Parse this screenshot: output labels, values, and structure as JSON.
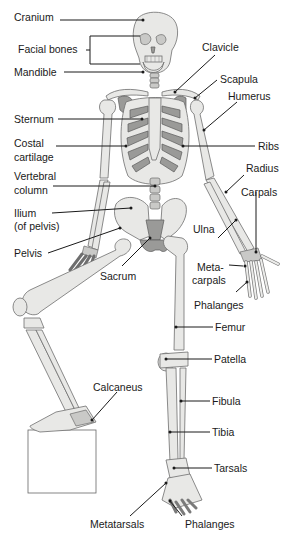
{
  "diagram": {
    "labels": {
      "cranium": "Cranium",
      "facial_bones": "Facial bones",
      "mandible": "Mandible",
      "clavicle": "Clavicle",
      "scapula": "Scapula",
      "humerus": "Humerus",
      "sternum": "Sternum",
      "costal_cartilage_1": "Costal",
      "costal_cartilage_2": "cartilage",
      "ribs": "Ribs",
      "vertebral_column_1": "Vertebral",
      "vertebral_column_2": "column",
      "radius": "Radius",
      "carpals": "Carpals",
      "ilium_1": "Ilium",
      "ilium_2": "(of pelvis)",
      "ulna": "Ulna",
      "pelvis": "Pelvis",
      "sacrum": "Sacrum",
      "metacarpals_1": "Meta-",
      "metacarpals_2": "carpals",
      "phalanges_hand": "Phalanges",
      "femur": "Femur",
      "patella": "Patella",
      "fibula": "Fibula",
      "calcaneus": "Calcaneus",
      "tibia": "Tibia",
      "tarsals": "Tarsals",
      "metatarsals": "Metatarsals",
      "phalanges_foot": "Phalanges"
    },
    "colors": {
      "bone_light": "#e8e8e6",
      "bone_dark": "#9a9a98",
      "outline": "#6e6e6e",
      "text": "#1a1a1a",
      "background": "#ffffff"
    }
  }
}
